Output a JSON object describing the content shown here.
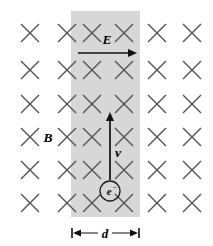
{
  "figure": {
    "background_color": "#ffffff",
    "band_color": "#d7d7d7",
    "xmark_color": "#565656",
    "vector_color": "#111111"
  },
  "field_region": {
    "name": "magnetic-field-into-page",
    "symbol": "B",
    "symbol_label": "B",
    "marker_glyph": "×",
    "marker_meaning": "field-into-page",
    "grid_columns": 6,
    "grid_rows": 6,
    "marker_count": 36,
    "column_x": [
      30,
      67,
      92,
      124,
      157,
      192
    ],
    "row_y": [
      33,
      70,
      104,
      137,
      170,
      203
    ]
  },
  "shaded_band": {
    "name": "electric-field-band",
    "label": "d",
    "width_label": "d",
    "left": 71,
    "right": 140,
    "top": 11,
    "bottom": 217
  },
  "vectors": [
    {
      "id": "electric-field",
      "label": "E",
      "direction": "right",
      "x1": 78,
      "y1": 53,
      "x2": 137,
      "y2": 53,
      "label_x": 107,
      "label_y": 44
    },
    {
      "id": "velocity",
      "label": "v",
      "direction": "up",
      "x1": 110,
      "y1": 180,
      "x2": 110,
      "y2": 112,
      "label_x": 118,
      "label_y": 157
    }
  ],
  "particle": {
    "name": "electron",
    "symbol": "e",
    "charge_sign": "−",
    "label": "e⁻",
    "center_x": 110,
    "center_y": 191,
    "radius": 10
  },
  "dimension": {
    "name": "band-width-dimension",
    "label": "d",
    "left": 72,
    "right": 139,
    "y": 233,
    "label_x": 105,
    "label_y": 238
  }
}
